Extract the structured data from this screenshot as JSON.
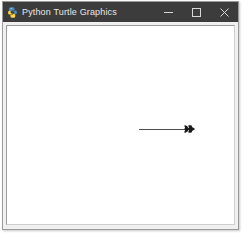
{
  "window": {
    "title": "Python Turtle Graphics",
    "icon": "python-turtle-icon",
    "titlebar_color": "#3c3c3c",
    "title_color": "#e8e8e8",
    "frame_color": "#f0f0f0",
    "controls": [
      {
        "name": "minimize-button",
        "glyph": "minimize-icon",
        "label": "Minimize"
      },
      {
        "name": "maximize-button",
        "glyph": "maximize-icon",
        "label": "Maximize"
      },
      {
        "name": "close-button",
        "glyph": "close-icon",
        "label": "Close"
      }
    ]
  },
  "canvas": {
    "name": "turtle-canvas",
    "background": "#ffffff",
    "width": 229,
    "height": 201,
    "drawing": {
      "pen_color": "#4d4d4d",
      "pen_width": 1,
      "turtle_color": "#1a1a1a",
      "turtle_heading_degrees": 0,
      "paths": [
        {
          "name": "horizontal-line",
          "type": "line",
          "from": [
            132,
            103
          ],
          "to": [
            187,
            103
          ]
        }
      ],
      "turtle_position": [
        187,
        103
      ]
    }
  }
}
